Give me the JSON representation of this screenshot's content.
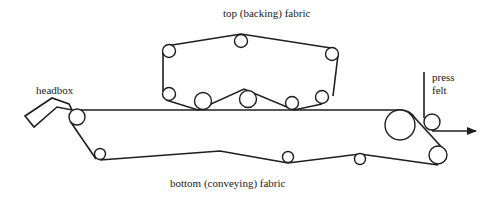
{
  "diagram": {
    "type": "twin-wire forming section schematic",
    "labels": {
      "top_fabric": "top (backing) fabric",
      "bottom_fabric": "bottom (conveying) fabric",
      "headbox": "headbox",
      "press_felt_line1": "press",
      "press_felt_line2": "felt"
    },
    "components": {
      "headbox": {
        "name": "headbox"
      },
      "top_fabric_rolls": [
        {
          "id": "tl",
          "cx": 169,
          "cy": 52,
          "r": 6.5
        },
        {
          "id": "tm",
          "cx": 241,
          "cy": 40,
          "r": 6.5
        },
        {
          "id": "tr",
          "cx": 332,
          "cy": 54,
          "r": 6.5
        },
        {
          "id": "bl",
          "cx": 170,
          "cy": 94,
          "r": 6.5
        },
        {
          "id": "v1",
          "cx": 203,
          "cy": 101,
          "r": 8.5
        },
        {
          "id": "v2",
          "cx": 248,
          "cy": 98,
          "r": 8.5
        },
        {
          "id": "v3",
          "cx": 292,
          "cy": 103,
          "r": 6.5
        },
        {
          "id": "br",
          "cx": 322,
          "cy": 97,
          "r": 6.5
        }
      ],
      "bottom_fabric_rolls": [
        {
          "id": "breast",
          "cx": 77,
          "cy": 117,
          "r": 8
        },
        {
          "id": "b1",
          "cx": 100,
          "cy": 154,
          "r": 5.5
        },
        {
          "id": "b2",
          "cx": 220,
          "cy": 155,
          "r": 5.5
        },
        {
          "id": "b3",
          "cx": 288,
          "cy": 157,
          "r": 5.5
        },
        {
          "id": "b4",
          "cx": 360,
          "cy": 159,
          "r": 5.5
        },
        {
          "id": "couch",
          "cx": 400,
          "cy": 125,
          "r": 15
        },
        {
          "id": "turn",
          "cx": 438,
          "cy": 155,
          "r": 9
        },
        {
          "id": "pickup",
          "cx": 432,
          "cy": 122,
          "r": 8
        }
      ]
    },
    "colors": {
      "line": "#1e1e1e",
      "background": "#ffffff"
    }
  }
}
